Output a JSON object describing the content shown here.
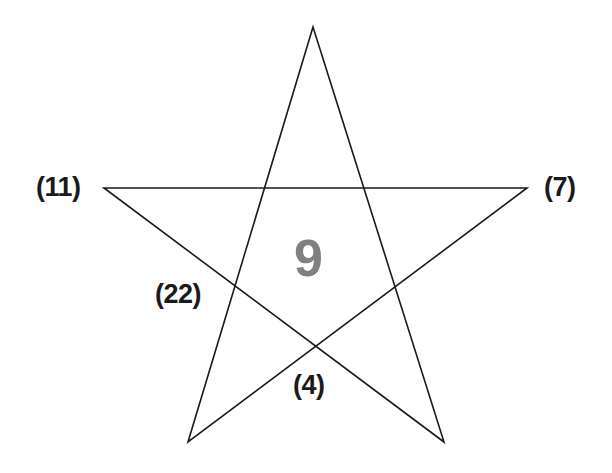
{
  "figure": {
    "type": "pentagram-star-diagram",
    "background_color": "#ffffff",
    "stroke_color": "#1a1a1a",
    "stroke_width": 1.6,
    "canvas": {
      "width": 612,
      "height": 473
    }
  },
  "star": {
    "shape_name": "five-pointed-star",
    "points_count": 5,
    "drawn_as": "continuous self-intersecting polyline",
    "vertices": [
      {
        "name": "top",
        "x": 313,
        "y": 27
      },
      {
        "name": "right",
        "x": 527,
        "y": 188
      },
      {
        "name": "bottom-right",
        "x": 444,
        "y": 442
      },
      {
        "name": "bottom-left",
        "x": 188,
        "y": 442
      },
      {
        "name": "left",
        "x": 104,
        "y": 188
      }
    ],
    "path_order": [
      0,
      2,
      4,
      1,
      3,
      0
    ]
  },
  "labels": {
    "left": "(11)",
    "right": "(7)",
    "lower_left": "(22)",
    "bottom": "(4)"
  },
  "center": {
    "value": "9",
    "color": "#808080"
  },
  "chart_data": {
    "type": "diagram",
    "title": "",
    "shape": "pentagram",
    "annotations": [
      {
        "label": "(11)",
        "position": "left-point",
        "value": 11
      },
      {
        "label": "(7)",
        "position": "right-point",
        "value": 7
      },
      {
        "label": "(22)",
        "position": "lower-left-inner",
        "value": 22
      },
      {
        "label": "(4)",
        "position": "bottom-center",
        "value": 4
      },
      {
        "label": "9",
        "position": "center",
        "value": 9
      }
    ]
  }
}
